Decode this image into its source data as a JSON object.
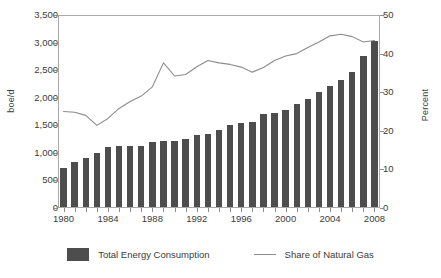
{
  "chart_data": {
    "type": "bar",
    "title": "",
    "xlabel": "",
    "ylabel": "boe/d",
    "ylabel_right": "Percent",
    "ylim": [
      0,
      3500
    ],
    "ylim_right": [
      0,
      50
    ],
    "ytick_labels": [
      "0",
      "500",
      "1,000",
      "1,500",
      "2,000",
      "2,500",
      "3,000",
      "3,500"
    ],
    "ytick_values": [
      0,
      500,
      1000,
      1500,
      2000,
      2500,
      3000,
      3500
    ],
    "ytick_labels_right": [
      "0",
      "10",
      "20",
      "30",
      "40",
      "50"
    ],
    "ytick_values_right": [
      0,
      10,
      20,
      30,
      40,
      50
    ],
    "xtick_labels": [
      "1980",
      "1984",
      "1988",
      "1992",
      "1996",
      "2000",
      "2004",
      "2008"
    ],
    "xtick_values": [
      1980,
      1984,
      1988,
      1992,
      1996,
      2000,
      2004,
      2008
    ],
    "categories": [
      1980,
      1981,
      1982,
      1983,
      1984,
      1985,
      1986,
      1987,
      1988,
      1989,
      1990,
      1991,
      1992,
      1993,
      1994,
      1995,
      1996,
      1997,
      1998,
      1999,
      2000,
      2001,
      2002,
      2003,
      2004,
      2005,
      2006,
      2007,
      2008
    ],
    "grid": false,
    "legend_position": "bottom",
    "series": [
      {
        "name": "Total Energy Consumption",
        "type": "bar",
        "axis": "left",
        "unit": "boe/d",
        "color": "#4d4d4d",
        "values": [
          700,
          820,
          890,
          980,
          1090,
          1100,
          1100,
          1110,
          1180,
          1190,
          1200,
          1230,
          1310,
          1330,
          1400,
          1480,
          1530,
          1550,
          1680,
          1700,
          1760,
          1860,
          1960,
          2080,
          2200,
          2310,
          2440,
          2740,
          3010
        ]
      },
      {
        "name": "Share of Natural Gas",
        "type": "line",
        "axis": "right",
        "unit": "Percent",
        "color": "#8c8c8c",
        "values": [
          25.0,
          24.8,
          24.0,
          21.4,
          23.2,
          25.8,
          27.6,
          29.0,
          31.4,
          37.6,
          34.2,
          34.6,
          36.6,
          38.2,
          37.6,
          37.2,
          36.5,
          35.2,
          36.4,
          38.2,
          39.4,
          40.0,
          41.6,
          43.0,
          44.6,
          45.0,
          44.4,
          43.0,
          43.4
        ]
      }
    ]
  },
  "legend": {
    "items": [
      {
        "label": "Total Energy Consumption",
        "marker": "bar-swatch"
      },
      {
        "label": "Share of Natural Gas",
        "marker": "line-swatch"
      }
    ]
  }
}
